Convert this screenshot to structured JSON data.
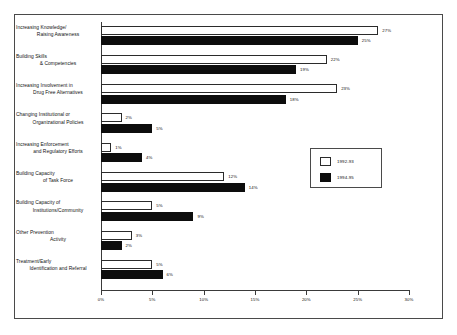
{
  "chart_data": {
    "type": "bar",
    "orientation": "horizontal",
    "title": "",
    "xlabel": "",
    "ylabel": "",
    "xlim": [
      0,
      30
    ],
    "xticks": [
      "0%",
      "5%",
      "10%",
      "15%",
      "20%",
      "25%",
      "30%"
    ],
    "xtick_values": [
      0,
      5,
      10,
      15,
      20,
      25,
      30
    ],
    "grid": false,
    "legend_position": "middle-right",
    "categories": [
      "Increasing Knowledge/ Raising Awareness",
      "Building Skills & Competencies",
      "Increasing Involvement in Drug Free Alternatives",
      "Changing Institutional or Organizational Policies",
      "Increasing Enforcement and Regulatory Efforts",
      "Building Capacity of Task Force",
      "Building Capacity of Institutions/Community",
      "Other Prevention Activity",
      "Treatment/Early Identification and Referral"
    ],
    "category_lines": [
      [
        "Increasing Knowledge/",
        "Raising Awareness"
      ],
      [
        "Building Skills",
        "& Competencies"
      ],
      [
        "Increasing Involvement in",
        "Drug Free Alternatives"
      ],
      [
        "Changing Institutional or",
        "Organizational Policies"
      ],
      [
        "Increasing Enforcement",
        "and Regulatory Efforts"
      ],
      [
        "Building Capacity",
        "of Task Force"
      ],
      [
        "Building Capacity of",
        "Institutions/Community"
      ],
      [
        "Other Prevention",
        "Activity"
      ],
      [
        "Treatment/Early",
        "Identification and Referral"
      ]
    ],
    "series": [
      {
        "name": "1992-93",
        "color": "#ffffff",
        "values": [
          27,
          22,
          23,
          2,
          1,
          12,
          5,
          3,
          5
        ],
        "labels": [
          "27%",
          "22%",
          "23%",
          "2%",
          "1%",
          "12%",
          "5%",
          "3%",
          "5%"
        ]
      },
      {
        "name": "1994-95",
        "color": "#0d0d0d",
        "values": [
          25,
          19,
          18,
          5,
          4,
          14,
          9,
          2,
          6
        ],
        "labels": [
          "25%",
          "19%",
          "18%",
          "5%",
          "4%",
          "14%",
          "9%",
          "2%",
          "6%"
        ]
      }
    ]
  },
  "legend": {
    "entries": [
      {
        "label": "1992-93",
        "swatch": "open-square-swatch"
      },
      {
        "label": "1994-95",
        "swatch": "filled-square-swatch"
      }
    ]
  }
}
